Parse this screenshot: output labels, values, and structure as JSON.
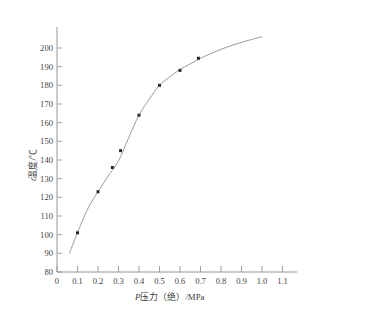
{
  "figure": {
    "background_color": "#ffffff",
    "curve_color": "#8f8f97",
    "point_color": "#2b2b2b",
    "axis_color": "#8a8a8a"
  },
  "axes": {
    "x_title_italic": "P",
    "x_title_rest": "压力（绝）/MPa",
    "y_title_italic": "t",
    "y_title_rest": "温度/℃",
    "x_ticks": [
      "0",
      "0.1",
      "0.2",
      "0.3",
      "0.4",
      "0.5",
      "0.6",
      "0.7",
      "0.8",
      "0.9",
      "1.0",
      "1.1"
    ],
    "y_ticks": [
      "200",
      "190",
      "180",
      "170",
      "160",
      "150",
      "140",
      "130",
      "120",
      "110",
      "100",
      "90",
      "80"
    ]
  },
  "chart_data": {
    "type": "line",
    "title": "",
    "subtitle": "",
    "xlabel": "P压力（绝）/MPa",
    "ylabel": "t温度/℃",
    "xlim": [
      0,
      1.15
    ],
    "ylim": [
      80,
      210
    ],
    "xtick_values": [
      0,
      0.1,
      0.2,
      0.3,
      0.4,
      0.5,
      0.6,
      0.7,
      0.8,
      0.9,
      1.0,
      1.1
    ],
    "ytick_values": [
      80,
      90,
      100,
      110,
      120,
      130,
      140,
      150,
      160,
      170,
      180,
      190,
      200
    ],
    "grid": false,
    "legend": null,
    "series": [
      {
        "name": "饱和温度曲线",
        "kind": "line",
        "x": [
          0.06,
          0.08,
          0.1,
          0.13,
          0.16,
          0.2,
          0.25,
          0.3,
          0.35,
          0.4,
          0.45,
          0.5,
          0.55,
          0.6,
          0.65,
          0.7,
          0.75,
          0.8,
          0.85,
          0.9,
          0.95,
          1.0
        ],
        "y": [
          90.0,
          95.5,
          101.0,
          109.0,
          116.0,
          123.0,
          131.5,
          139.5,
          152.0,
          164.0,
          172.5,
          180.0,
          184.5,
          188.5,
          191.5,
          194.5,
          197.0,
          199.3,
          201.3,
          203.0,
          204.6,
          206.0
        ]
      },
      {
        "name": "实测数据点",
        "kind": "scatter",
        "x": [
          0.1,
          0.2,
          0.27,
          0.31,
          0.4,
          0.5,
          0.6,
          0.69
        ],
        "y": [
          101.0,
          123.0,
          136.0,
          145.0,
          164.0,
          180.0,
          188.0,
          194.5
        ]
      }
    ]
  }
}
